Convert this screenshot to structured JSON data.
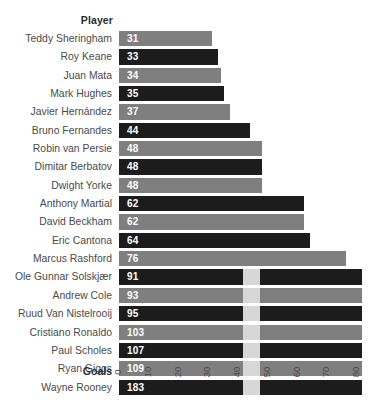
{
  "header": {
    "column_label": "Player"
  },
  "axis": {
    "title": "Goals",
    "ticks": [
      "0",
      "10",
      "20",
      "30",
      "40",
      "50",
      "60",
      "70",
      "80"
    ]
  },
  "colors": {
    "bar_light": "#7f7f7f",
    "bar_dark": "#1c1c1c",
    "overflow_shade": "#d7d7d7",
    "label_text": "#4a4a4a",
    "value_text": "#ffffff",
    "background": "#ffffff"
  },
  "chart_data": {
    "type": "bar",
    "orientation": "horizontal",
    "title": "",
    "xlabel": "Goals",
    "ylabel": "Player",
    "xlim": [
      0,
      80
    ],
    "grid": false,
    "legend": "none",
    "note": "Bars exceeding the 80-goal axis maximum are clipped at the plot edge",
    "categories": [
      "Teddy Sheringham",
      "Roy Keane",
      "Juan Mata",
      "Mark Hughes",
      "Javier Hernández",
      "Bruno Fernandes",
      "Robin van Persie",
      "Dimitar Berbatov",
      "Dwight Yorke",
      "Anthony Martial",
      "David Beckham",
      "Eric Cantona",
      "Marcus Rashford",
      "Ole Gunnar Solskjær",
      "Andrew Cole",
      "Ruud Van Nistelrooij",
      "Cristiano Ronaldo",
      "Paul Scholes",
      "Ryan Giggs",
      "Wayne Rooney"
    ],
    "values": [
      31,
      33,
      34,
      35,
      37,
      44,
      48,
      48,
      48,
      62,
      62,
      64,
      76,
      91,
      93,
      95,
      103,
      107,
      109,
      183
    ],
    "bar_styles": [
      "light",
      "dark",
      "light",
      "dark",
      "light",
      "dark",
      "light",
      "dark",
      "light",
      "dark",
      "light",
      "dark",
      "light",
      "dark",
      "light",
      "dark",
      "light",
      "dark",
      "light",
      "dark"
    ]
  }
}
